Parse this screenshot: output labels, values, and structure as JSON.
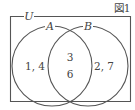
{
  "figure": {
    "caption": "図1",
    "universe_label": "U",
    "set_a_label": "A",
    "set_b_label": "B"
  },
  "regions": {
    "a_only": "1, 4",
    "a_and_b": [
      "3",
      "6"
    ],
    "b_only": "2, 7"
  },
  "colors": {
    "stroke": "#555555",
    "text": "#444444",
    "background": "#ffffff"
  }
}
